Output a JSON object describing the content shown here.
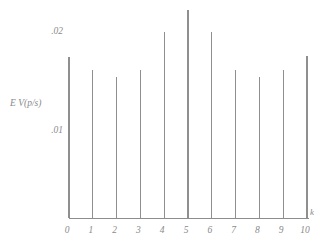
{
  "chart_data": {
    "type": "bar",
    "title": "",
    "subtitle": "",
    "xlabel": "k",
    "ylabel": "E V(p/s)",
    "categories": [
      "0",
      "1",
      "2",
      "3",
      "4",
      "5",
      "6",
      "7",
      "8",
      "9",
      "10"
    ],
    "x": [
      0,
      1,
      2,
      3,
      4,
      5,
      6,
      7,
      8,
      9,
      10
    ],
    "values": [
      0.0174,
      0.0161,
      0.0154,
      0.0161,
      0.0199,
      0.0221,
      0.0199,
      0.0161,
      0.0154,
      0.0161,
      0.0175
    ],
    "xlim": [
      0,
      10
    ],
    "ylim": [
      0,
      0.0235
    ],
    "yticks": [
      0.01,
      0.02
    ],
    "ytick_labels": [
      ".01",
      ".02"
    ],
    "xticks": [
      0,
      1,
      2,
      3,
      4,
      5,
      6,
      7,
      8,
      9,
      10
    ],
    "xtick_labels": [
      "0",
      "1",
      "2",
      "3",
      "4",
      "5",
      "6",
      "7",
      "8",
      "9",
      "10"
    ],
    "grid": false,
    "legend": false,
    "legend_position": "none",
    "series": [
      {
        "name": "E V(p/s)",
        "values": [
          0.0174,
          0.0161,
          0.0154,
          0.0161,
          0.0199,
          0.0221,
          0.0199,
          0.0161,
          0.0154,
          0.0161,
          0.0175
        ]
      }
    ],
    "annotations": []
  },
  "axes": {
    "y_axis_title": "E V(p/s)",
    "x_axis_title": "k",
    "y_tick_top_label": ".02",
    "y_tick_bottom_label": ".01"
  },
  "xtick_text": {
    "t0": "0",
    "t1": "1",
    "t2": "2",
    "t3": "3",
    "t4": "4",
    "t5": "5",
    "t6": "6",
    "t7": "7",
    "t8": "8",
    "t9": "9",
    "t10": "10"
  },
  "style": {
    "line_color": "#8d8d8d",
    "text_color": "#8a8a8a",
    "background": "#ffffff"
  }
}
